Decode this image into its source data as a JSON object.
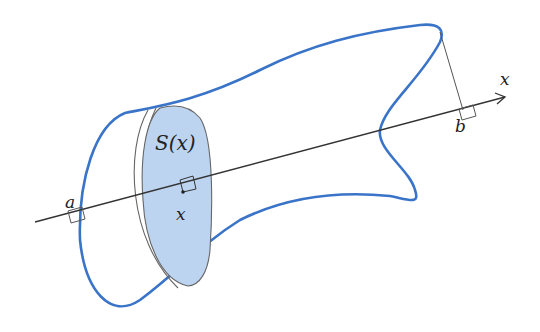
{
  "diagram": {
    "labels": {
      "axis": "x",
      "a": "a",
      "b": "b",
      "x_point": "x",
      "section": "S(x)"
    },
    "colors": {
      "outline": "#3a74c9",
      "section_fill": "#bdd4f0",
      "line": "#333333"
    }
  }
}
